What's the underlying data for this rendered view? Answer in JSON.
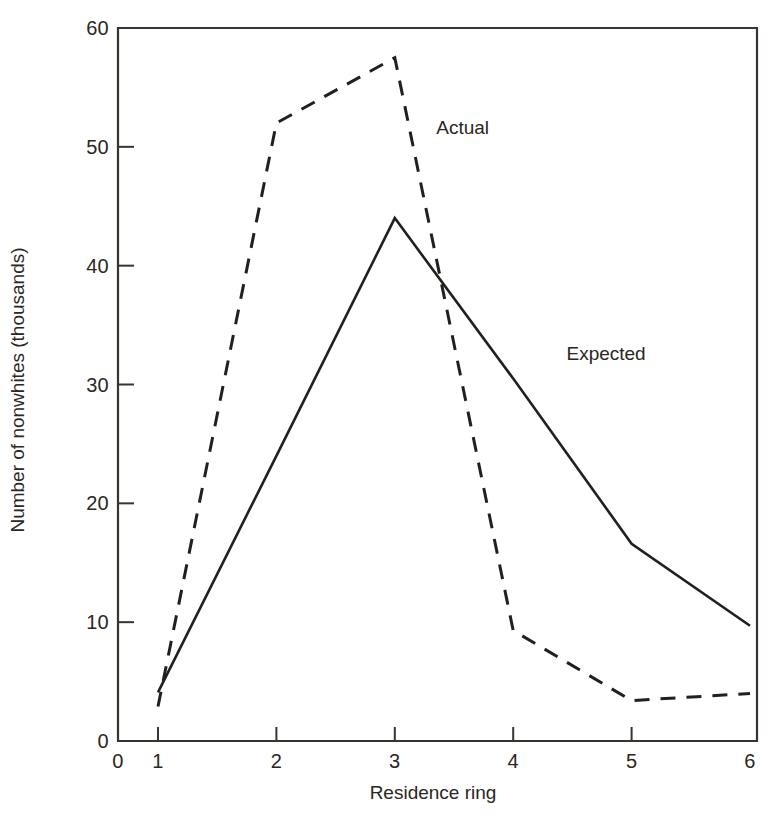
{
  "chart_data": {
    "type": "line",
    "title": "",
    "xlabel": "Residence ring",
    "ylabel": "Number of nonwhites (thousands)",
    "x": [
      1,
      2,
      3,
      4,
      5,
      6
    ],
    "xlim": [
      0,
      6
    ],
    "ylim": [
      0,
      60
    ],
    "xticks": [
      0,
      1,
      2,
      3,
      4,
      5,
      6
    ],
    "xtick_labels": [
      "0",
      "1",
      "2",
      "3",
      "4",
      "5",
      "6"
    ],
    "yticks": [
      0,
      10,
      20,
      30,
      40,
      50,
      60
    ],
    "ytick_labels": [
      "0",
      "10",
      "20",
      "30",
      "40",
      "50",
      "60"
    ],
    "grid": false,
    "legend_position": "inline-annotations",
    "series": [
      {
        "name": "Actual",
        "style": "dashed",
        "color": "#231f1c",
        "values": [
          2.9,
          52.0,
          57.5,
          9.3,
          3.4,
          4.0
        ]
      },
      {
        "name": "Expected",
        "style": "solid",
        "color": "#231f1c",
        "values": [
          4.1,
          24.0,
          44.0,
          30.5,
          16.6,
          9.7
        ]
      }
    ],
    "annotations": [
      {
        "text": "Actual",
        "x": 3.35,
        "y": 51.5
      },
      {
        "text": "Expected",
        "x": 4.45,
        "y": 32.5
      }
    ]
  },
  "axis_titles": {
    "y": "Number of nonwhites (thousands)",
    "x": "Residence ring"
  }
}
